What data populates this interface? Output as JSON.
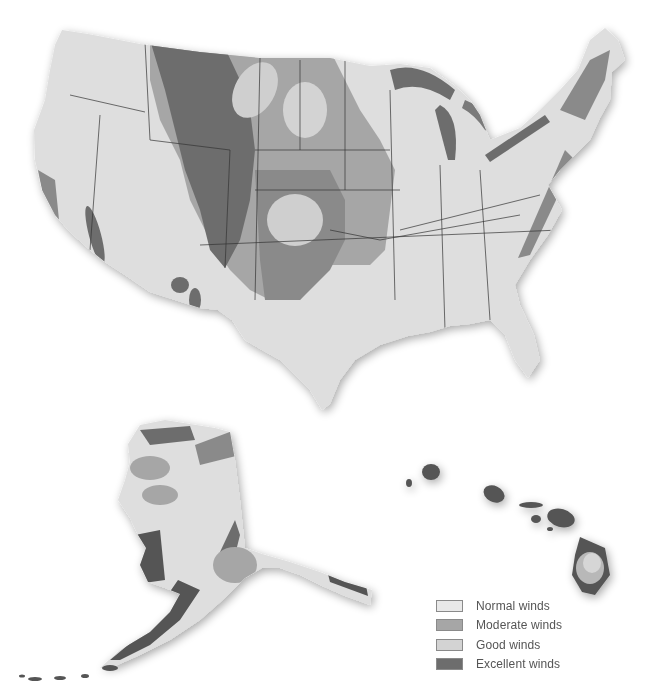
{
  "map": {
    "subject": "United States wind resource map",
    "regions": [
      "Contiguous United States",
      "Alaska",
      "Hawaii"
    ]
  },
  "legend": {
    "items": [
      {
        "label": "Normal winds",
        "color": "#e9e9e9"
      },
      {
        "label": "Moderate winds",
        "color": "#a6a6a6"
      },
      {
        "label": "Good winds",
        "color": "#d3d3d3"
      },
      {
        "label": "Excellent winds",
        "color": "#6d6d6d"
      }
    ]
  },
  "colors": {
    "land": "#dcdcdc",
    "normal": "#e9e9e9",
    "moderate": "#a6a6a6",
    "good": "#d3d3d3",
    "excellent": "#6d6d6d",
    "border": "#333333",
    "background": "#ffffff"
  }
}
